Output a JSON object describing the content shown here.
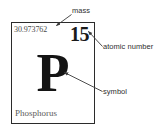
{
  "element_cell": {
    "atomic_mass": "30.973762",
    "atomic_number": "15",
    "symbol": "P",
    "name": "Phosphorus",
    "border_color": "#2b2b2b",
    "background_color": "#ffffff",
    "symbol_color": "#141414",
    "name_color": "#5c5c5c",
    "mass_color": "#4a4a4a"
  },
  "callouts": {
    "mass": "mass",
    "atomic_number": "atomic number",
    "symbol": "symbol",
    "line_color": "#3a3a3a"
  }
}
